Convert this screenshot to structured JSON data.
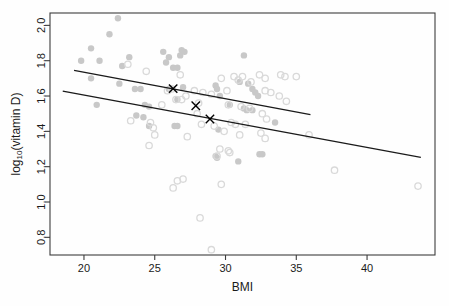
{
  "chart_data": {
    "type": "scatter",
    "title": "",
    "xlabel": "BMI",
    "ylabel": "log10(vitamin D)",
    "ylabel_base": "log",
    "ylabel_sub": "10",
    "ylabel_rest": "(vitamin D)",
    "xlim": [
      17.6,
      44.8
    ],
    "ylim": [
      0.7,
      2.07
    ],
    "xticks": [
      20,
      25,
      30,
      35,
      40
    ],
    "yticks": [
      0.8,
      1.0,
      1.2,
      1.4,
      1.6,
      1.8,
      2.0
    ],
    "xtick_labels": [
      "20",
      "25",
      "30",
      "35",
      "40"
    ],
    "ytick_labels": [
      "0.8",
      "1.0",
      "1.2",
      "1.4",
      "1.6",
      "1.8",
      "2.0"
    ],
    "grid": false,
    "legend": "none",
    "frame": true,
    "series": [
      {
        "name": "filled-group",
        "marker": "filled-circle",
        "color": "#c8c8c8",
        "points": [
          [
            22.4,
            2.04
          ],
          [
            21.8,
            1.95
          ],
          [
            20.5,
            1.87
          ],
          [
            26.9,
            1.86
          ],
          [
            27.1,
            1.85
          ],
          [
            25.6,
            1.85
          ],
          [
            26.0,
            1.82
          ],
          [
            23.2,
            1.82
          ],
          [
            19.8,
            1.8
          ],
          [
            21.1,
            1.8
          ],
          [
            31.3,
            1.83
          ],
          [
            26.8,
            1.83
          ],
          [
            25.8,
            1.79
          ],
          [
            22.7,
            1.77
          ],
          [
            26.3,
            1.76
          ],
          [
            26.6,
            1.76
          ],
          [
            20.5,
            1.7
          ],
          [
            22.5,
            1.67
          ],
          [
            29.3,
            1.66
          ],
          [
            31.0,
            1.68
          ],
          [
            31.6,
            1.67
          ],
          [
            23.6,
            1.64
          ],
          [
            24.0,
            1.64
          ],
          [
            26.0,
            1.64
          ],
          [
            27.0,
            1.65
          ],
          [
            32.1,
            1.62
          ],
          [
            31.9,
            1.64
          ],
          [
            29.4,
            1.64
          ],
          [
            32.3,
            1.6
          ],
          [
            29.6,
            1.6
          ],
          [
            30.3,
            1.55
          ],
          [
            31.3,
            1.53
          ],
          [
            31.5,
            1.52
          ],
          [
            31.9,
            1.52
          ],
          [
            24.3,
            1.55
          ],
          [
            20.9,
            1.55
          ],
          [
            24.6,
            1.54
          ],
          [
            26.6,
            1.58
          ],
          [
            23.7,
            1.49
          ],
          [
            24.2,
            1.48
          ],
          [
            26.4,
            1.43
          ],
          [
            26.6,
            1.43
          ],
          [
            29.5,
            1.41
          ],
          [
            29.3,
            1.26
          ],
          [
            29.4,
            1.25
          ],
          [
            30.9,
            1.23
          ],
          [
            32.4,
            1.27
          ],
          [
            32.6,
            1.27
          ],
          [
            33.5,
            1.45
          ],
          [
            24.6,
            1.43
          ]
        ]
      },
      {
        "name": "open-group",
        "marker": "open-circle",
        "color": "#d9d9d9",
        "points": [
          [
            23.1,
            1.78
          ],
          [
            24.4,
            1.74
          ],
          [
            26.8,
            1.72
          ],
          [
            30.6,
            1.71
          ],
          [
            31.2,
            1.71
          ],
          [
            32.4,
            1.72
          ],
          [
            33.9,
            1.72
          ],
          [
            34.2,
            1.71
          ],
          [
            35.0,
            1.71
          ],
          [
            29.7,
            1.7
          ],
          [
            30.9,
            1.69
          ],
          [
            31.8,
            1.68
          ],
          [
            32.8,
            1.7
          ],
          [
            30.1,
            1.63
          ],
          [
            32.8,
            1.63
          ],
          [
            33.2,
            1.62
          ],
          [
            33.8,
            1.6
          ],
          [
            34.3,
            1.57
          ],
          [
            29.0,
            1.61
          ],
          [
            28.4,
            1.62
          ],
          [
            27.8,
            1.63
          ],
          [
            26.2,
            1.64
          ],
          [
            25.9,
            1.63
          ],
          [
            27.2,
            1.6
          ],
          [
            26.5,
            1.58
          ],
          [
            26.9,
            1.58
          ],
          [
            28.1,
            1.56
          ],
          [
            30.2,
            1.55
          ],
          [
            31.1,
            1.54
          ],
          [
            31.7,
            1.53
          ],
          [
            32.6,
            1.5
          ],
          [
            32.9,
            1.47
          ],
          [
            30.4,
            1.45
          ],
          [
            30.7,
            1.44
          ],
          [
            31.4,
            1.44
          ],
          [
            29.9,
            1.4
          ],
          [
            31.0,
            1.38
          ],
          [
            32.5,
            1.39
          ],
          [
            32.8,
            1.36
          ],
          [
            23.3,
            1.46
          ],
          [
            24.7,
            1.45
          ],
          [
            24.9,
            1.42
          ],
          [
            25.0,
            1.38
          ],
          [
            27.3,
            1.37
          ],
          [
            28.3,
            1.44
          ],
          [
            29.2,
            1.43
          ],
          [
            24.6,
            1.32
          ],
          [
            29.6,
            1.3
          ],
          [
            30.2,
            1.29
          ],
          [
            30.3,
            1.28
          ],
          [
            29.4,
            1.26
          ],
          [
            26.6,
            1.12
          ],
          [
            27.0,
            1.13
          ],
          [
            26.3,
            1.08
          ],
          [
            29.7,
            1.1
          ],
          [
            37.7,
            1.18
          ],
          [
            43.6,
            1.09
          ],
          [
            28.2,
            0.91
          ],
          [
            29.0,
            0.73
          ],
          [
            35.9,
            1.38
          ],
          [
            25.5,
            1.55
          ],
          [
            28.0,
            1.5
          ]
        ]
      }
    ],
    "lines": [
      {
        "name": "upper-fit-line",
        "color": "#1a1a1a",
        "x0": 19.3,
        "y0": 1.745,
        "x1": 36.0,
        "y1": 1.495
      },
      {
        "name": "lower-fit-line",
        "color": "#1a1a1a",
        "x0": 18.5,
        "y0": 1.628,
        "x1": 43.8,
        "y1": 1.253
      }
    ],
    "markers_x": [
      {
        "name": "x-marker-1",
        "x": 26.3,
        "y": 1.642
      },
      {
        "name": "x-marker-2",
        "x": 27.9,
        "y": 1.545
      },
      {
        "name": "x-marker-3",
        "x": 28.9,
        "y": 1.47
      }
    ]
  }
}
